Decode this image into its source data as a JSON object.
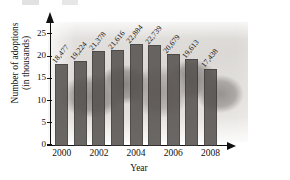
{
  "chart_data": {
    "type": "bar",
    "title": "",
    "xlabel": "Year",
    "ylabel": "Number of adoptions\n(in thousands)",
    "ylabel_line1": "Number of adoptions",
    "ylabel_line2": "(in thousands)",
    "categories": [
      "2000",
      "2001",
      "2002",
      "2003",
      "2004",
      "2005",
      "2006",
      "2007",
      "2008"
    ],
    "x_tick_labels": [
      "2000",
      "2002",
      "2004",
      "2006",
      "2008"
    ],
    "values": [
      18.477,
      19.224,
      21.378,
      21.616,
      22.884,
      22.739,
      20.679,
      19.613,
      17.438
    ],
    "data_labels": [
      "18,477",
      "19,224",
      "21,378",
      "21,616",
      "22,884",
      "22,739",
      "20,679",
      "19,613",
      "17,438"
    ],
    "y_ticks": [
      0,
      5,
      10,
      15,
      20,
      25
    ],
    "y_tick_labels": [
      "0",
      "5",
      "10",
      "15",
      "20",
      "25"
    ],
    "ylim": [
      0,
      27
    ],
    "grid": false,
    "legend": false,
    "bar_color": "#575350",
    "axis_color": "#111111",
    "background_note": "faded photograph of children's faces behind plot"
  }
}
